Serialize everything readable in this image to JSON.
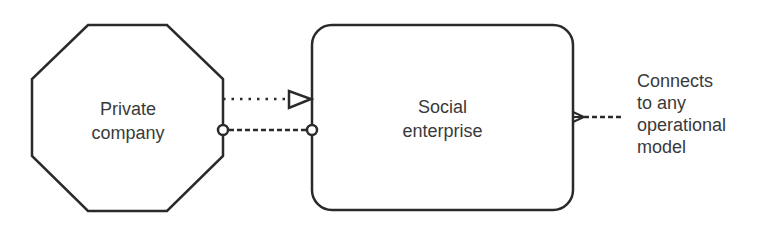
{
  "diagram": {
    "nodes": [
      {
        "id": "private-company",
        "shape": "octagon",
        "line1": "Private",
        "line2": "company"
      },
      {
        "id": "social-enterprise",
        "shape": "rounded-rectangle",
        "line1": "Social",
        "line2": "enterprise"
      }
    ],
    "edges": [
      {
        "from": "private-company",
        "to": "social-enterprise",
        "style": "dotted",
        "end": "open-triangle"
      },
      {
        "from": "private-company",
        "to": "social-enterprise",
        "style": "dashed",
        "start": "circle",
        "end": "circle"
      },
      {
        "from": "social-enterprise",
        "to": "external",
        "style": "dashed",
        "start": "crow-foot"
      }
    ],
    "annotation": {
      "lines": [
        "Connects",
        "to any",
        "operational",
        "model"
      ]
    },
    "colors": {
      "stroke": "#2a2a2a",
      "text": "#3a3a3a",
      "background": "#ffffff"
    }
  }
}
